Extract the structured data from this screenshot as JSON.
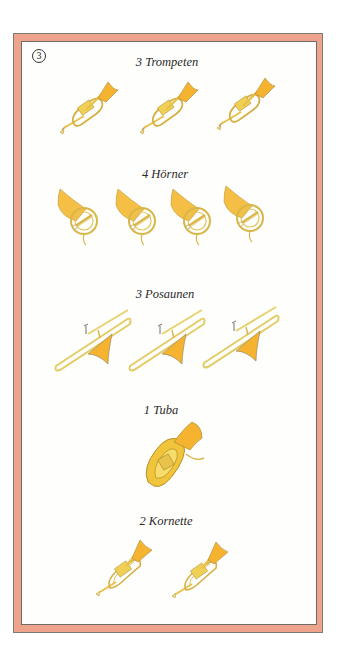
{
  "page_number": "3",
  "colors": {
    "frame_band": "#eea38c",
    "frame_line": "#7d7a74",
    "brass_light": "#f2de86",
    "brass": "#e9c14a",
    "bell": "#f5b330",
    "outline": "#b89a3c"
  },
  "sections": [
    {
      "label": "3 Trompeten",
      "instrument": "trumpet",
      "count": 3
    },
    {
      "label": "4 Hörner",
      "instrument": "horn",
      "count": 4
    },
    {
      "label": "3 Posaunen",
      "instrument": "trombone",
      "count": 3
    },
    {
      "label": "1 Tuba",
      "instrument": "tuba",
      "count": 1
    },
    {
      "label": "2 Kornette",
      "instrument": "cornet",
      "count": 2
    }
  ]
}
